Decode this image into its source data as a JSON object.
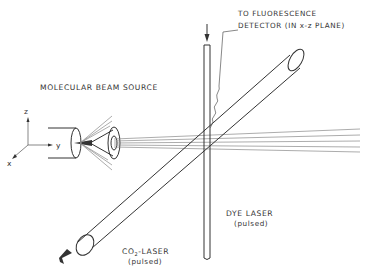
{
  "diagram": {
    "labels": {
      "source": "MOLECULAR BEAM SOURCE",
      "detector_line1": "TO FLUORESCENCE",
      "detector_line2": "DETECTOR (IN x-z PLANE)",
      "dye_laser": "DYE LASER",
      "dye_laser_mode": "(pulsed)",
      "co2_laser_prefix": "CO",
      "co2_laser_sub": "2",
      "co2_laser_suffix": "-LASER",
      "co2_laser_mode": "(pulsed)"
    },
    "axes": {
      "z": "z",
      "y": "y",
      "x": "x"
    },
    "colors": {
      "line": "#333333",
      "beam": "#888888",
      "background": "#ffffff"
    }
  }
}
